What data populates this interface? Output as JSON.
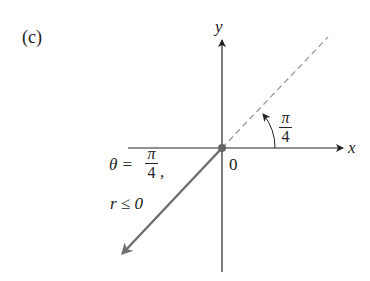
{
  "figure": {
    "panel_label": "(c)",
    "axes": {
      "x_label": "x",
      "y_label": "y",
      "origin_label": "0"
    },
    "angle": {
      "numerator": "π",
      "denominator": "4"
    },
    "condition": {
      "theta_prefix": "θ =",
      "theta_numerator": "π",
      "theta_denominator": "4",
      "comma": ",",
      "r_condition": "r ≤ 0"
    },
    "colors": {
      "axis": "#222222",
      "ray": "#6e6e6e",
      "dashed": "#9a9a9a",
      "origin_dot": "#666666"
    }
  }
}
